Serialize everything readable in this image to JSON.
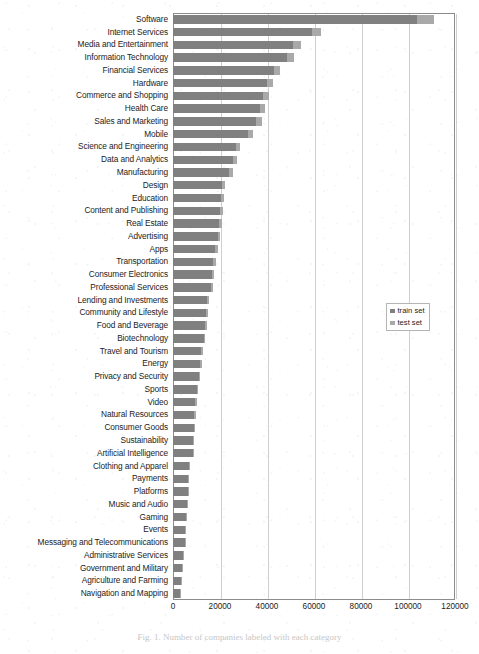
{
  "chart_data": {
    "type": "bar",
    "orientation": "horizontal",
    "stacked": true,
    "title": "",
    "subtitle": "",
    "xlabel": "",
    "ylabel": "",
    "xlim": [
      0,
      120000
    ],
    "xticks": [
      "0",
      "20000",
      "40000",
      "60000",
      "80000",
      "100000",
      "120000"
    ],
    "xtick_values": [
      0,
      20000,
      40000,
      60000,
      80000,
      100000,
      120000
    ],
    "grid": "vertical",
    "legend_position": "center-right",
    "legend": [
      "train set",
      "test set"
    ],
    "categories": [
      "Software",
      "Internet Services",
      "Media and Entertainment",
      "Information Technology",
      "Financial Services",
      "Hardware",
      "Commerce and Shopping",
      "Health Care",
      "Sales and Marketing",
      "Mobile",
      "Science and Engineering",
      "Data and Analytics",
      "Manufacturing",
      "Design",
      "Education",
      "Content and Publishing",
      "Real Estate",
      "Advertising",
      "Apps",
      "Transportation",
      "Consumer Electronics",
      "Professional Services",
      "Lending and Investments",
      "Community and Lifestyle",
      "Food and Beverage",
      "Biotechnology",
      "Travel and Tourism",
      "Energy",
      "Privacy and Security",
      "Sports",
      "Video",
      "Natural Resources",
      "Consumer Goods",
      "Sustainability",
      "Artificial Intelligence",
      "Clothing and Apparel",
      "Payments",
      "Platforms",
      "Music and Audio",
      "Gaming",
      "Events",
      "Messaging and Telecommunications",
      "Administrative Services",
      "Government and Military",
      "Agriculture and Farming",
      "Navigation and Mapping"
    ],
    "series": [
      {
        "name": "train set",
        "color": "#808080",
        "values": [
          104000,
          59000,
          51000,
          48500,
          43000,
          40000,
          38500,
          37000,
          35500,
          32000,
          27000,
          25500,
          24000,
          21000,
          20500,
          20000,
          19500,
          19000,
          18000,
          17000,
          16500,
          16000,
          14500,
          14000,
          13500,
          13000,
          12000,
          11500,
          11000,
          10000,
          9500,
          9000,
          8800,
          8600,
          8400,
          7000,
          6500,
          6300,
          5800,
          5600,
          5200,
          5000,
          4200,
          3800,
          3400,
          3000
        ]
      },
      {
        "name": "test set",
        "color": "#a9a9a9",
        "values": [
          7000,
          3800,
          3300,
          3000,
          2700,
          2500,
          2400,
          2300,
          2200,
          2000,
          1700,
          1600,
          1500,
          1300,
          1300,
          1250,
          1200,
          1200,
          1150,
          1100,
          1050,
          1000,
          950,
          900,
          850,
          800,
          750,
          720,
          700,
          650,
          600,
          580,
          560,
          540,
          520,
          450,
          420,
          400,
          380,
          360,
          340,
          320,
          270,
          250,
          220,
          200
        ]
      }
    ]
  },
  "legend": {
    "train_label": "train set",
    "test_label": "test set"
  },
  "caption": {
    "text": "Fig. 1. Number of companies labeled with each category"
  }
}
